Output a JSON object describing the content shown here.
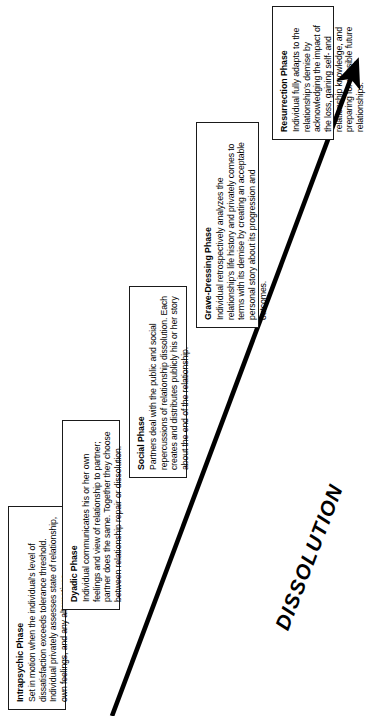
{
  "diagram": {
    "title": "DISSOLUTION",
    "flow_label": "DISSOLUTION",
    "orientation": "rotated-90-ccw",
    "arrow_color": "#000000",
    "box_border_color": "#1a1a1a",
    "background_color": "#ffffff",
    "phases": [
      {
        "id": "intrapsychic",
        "title": "Intrapsychic Phase",
        "body": "Set in motion when the individual's level of dissatisfaction exceeds tolerance threshold. Individual privately assesses state of relationship, own feelings, and any alternatives."
      },
      {
        "id": "dyadic",
        "title": "Dyadic Phase",
        "body": "Individual communicates his or her own feelings and view of relationship to partner; partner does the same. Together they choose between relationship repair or dissolution."
      },
      {
        "id": "social",
        "title": "Social Phase",
        "body": "Partners deal with the public and social repercussions of relationship dissolution. Each creates and distributes publicly his or her story about the end of the relationship."
      },
      {
        "id": "grave-dressing",
        "title": "Grave-Dressing Phase",
        "body": "Individual retrospectively analyzes the relationship's life history and privately comes to terms with its demise by creating an acceptable personal story about its progression and outcomes."
      },
      {
        "id": "resurrection",
        "title": "Resurrection Phase",
        "body": "Individual fully adapts to the relationship's demise by acknowledging the impact of the loss, gaining self- and relationship knowledge, and preparing for possible future relationships."
      }
    ]
  }
}
